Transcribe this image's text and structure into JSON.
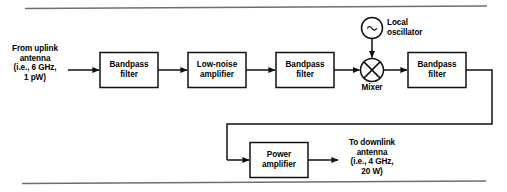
{
  "figure": {
    "type": "block-diagram"
  },
  "inputs": {
    "uplink_label": "From uplink\nantenna\n(i.e., 6 GHz,\n1 pW)"
  },
  "outputs": {
    "downlink_label": "To downlink\nantenna\n(i.e., 4 GHz,\n20 W)"
  },
  "blocks": [
    {
      "id": "bpf1",
      "label": "Bandpass\nfilter"
    },
    {
      "id": "lna",
      "label": "Low-noise\namplifier"
    },
    {
      "id": "bpf2",
      "label": "Bandpass\nfilter"
    },
    {
      "id": "bpf3",
      "label": "Bandpass\nfilter"
    },
    {
      "id": "pa",
      "label": "Power\namplifier"
    }
  ],
  "symbols": {
    "local_oscillator_label": "Local\noscillator",
    "local_oscillator_glyph": "~",
    "mixer_label": "Mixer"
  },
  "colors": {
    "line": "#111111",
    "rule": "#6b6b6b",
    "text": "#000000",
    "background": "#ffffff"
  }
}
